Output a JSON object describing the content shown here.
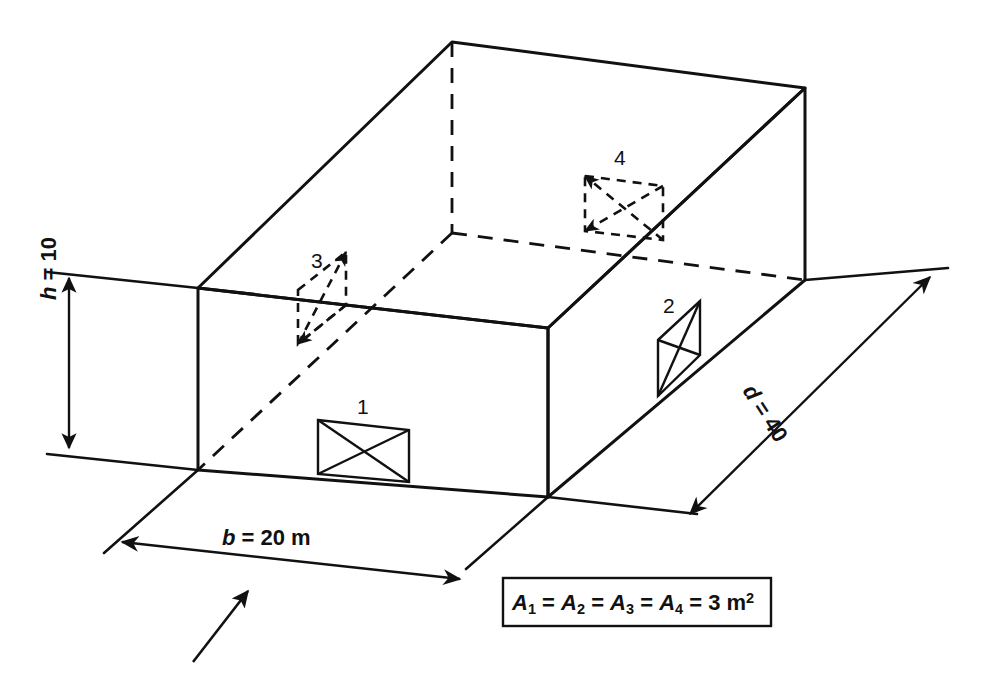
{
  "figure": {
    "background_color": "#ffffff",
    "line_color": "#111111"
  },
  "dimensions": [
    {
      "id": "height",
      "symbol": "h",
      "equals": "=",
      "value": "10",
      "unit": "",
      "label": "h = 10",
      "orientation": "vertical",
      "position": "left"
    },
    {
      "id": "breadth",
      "symbol": "b",
      "equals": "=",
      "value": "20",
      "unit": "m",
      "label": "b = 20 m",
      "orientation": "horizontal",
      "position": "bottom-front"
    },
    {
      "id": "depth",
      "symbol": "d",
      "equals": "=",
      "value": "40",
      "unit": "",
      "label": "d = 40",
      "orientation": "diagonal",
      "position": "right"
    }
  ],
  "openings": [
    {
      "id": "opening-1",
      "number": "1",
      "face": "front-wall",
      "visibility": "visible",
      "shape": "rectangle-with-x-diagonals"
    },
    {
      "id": "opening-2",
      "number": "2",
      "face": "right-wall",
      "visibility": "visible",
      "shape": "parallelogram-with-x-diagonals"
    },
    {
      "id": "opening-3",
      "number": "3",
      "face": "left-wall",
      "visibility": "hidden",
      "shape": "parallelogram-with-x-diagonals"
    },
    {
      "id": "opening-4",
      "number": "4",
      "face": "back-wall",
      "visibility": "hidden",
      "shape": "rectangle-with-x-diagonals"
    }
  ],
  "note": {
    "text": "A1 = A2 = A3 = A4 = 3 m2",
    "variable": "A",
    "indices": [
      "1",
      "2",
      "3",
      "4"
    ],
    "equals": "=",
    "value": "3",
    "unit": "m",
    "exponent": "2"
  },
  "wind_arrow": {
    "id": "wind-direction-arrow",
    "description": "incident flow direction arrow",
    "direction": "up-right"
  }
}
